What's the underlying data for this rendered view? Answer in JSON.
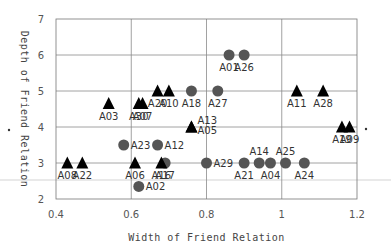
{
  "chart_data": {
    "type": "scatter",
    "title": "",
    "xlabel": "Width of Friend Relation",
    "ylabel": "Depth of Friend Relation",
    "xlim": [
      0.4,
      1.2
    ],
    "ylim": [
      2,
      7
    ],
    "xticks": [
      0.4,
      0.6,
      0.8,
      1.0,
      1.2
    ],
    "xtick_labels": [
      "0.4",
      "0.6",
      "0.8",
      "1",
      "1.2"
    ],
    "yticks": [
      2,
      3,
      4,
      5,
      6,
      7
    ],
    "ytick_labels": [
      "2",
      "3",
      "4",
      "5",
      "6",
      "7"
    ],
    "grid": true,
    "legend": "none",
    "series": [
      {
        "name": "circle",
        "marker": "circle",
        "color": "#555555",
        "points": [
          {
            "label": "A01",
            "x": 0.86,
            "y": 6.0,
            "pos": "below"
          },
          {
            "label": "A26",
            "x": 0.9,
            "y": 6.0,
            "pos": "below"
          },
          {
            "label": "A18",
            "x": 0.76,
            "y": 5.0,
            "pos": "below"
          },
          {
            "label": "A27",
            "x": 0.83,
            "y": 5.0,
            "pos": "below"
          },
          {
            "label": "A23",
            "x": 0.58,
            "y": 3.5,
            "pos": "right"
          },
          {
            "label": "A12",
            "x": 0.67,
            "y": 3.5,
            "pos": "right"
          },
          {
            "label": "A17",
            "x": 0.69,
            "y": 3.0,
            "pos": "below"
          },
          {
            "label": "A29",
            "x": 0.8,
            "y": 3.0,
            "pos": "right"
          },
          {
            "label": "A21",
            "x": 0.9,
            "y": 3.0,
            "pos": "below"
          },
          {
            "label": "A14",
            "x": 0.94,
            "y": 3.0,
            "pos": "above"
          },
          {
            "label": "A04",
            "x": 0.97,
            "y": 3.0,
            "pos": "below"
          },
          {
            "label": "A25",
            "x": 1.01,
            "y": 3.0,
            "pos": "above"
          },
          {
            "label": "A24",
            "x": 1.06,
            "y": 3.0,
            "pos": "below"
          },
          {
            "label": "A02",
            "x": 0.62,
            "y": 2.35,
            "pos": "right"
          }
        ]
      },
      {
        "name": "triangle",
        "marker": "triangle",
        "color": "#000000",
        "points": [
          {
            "label": "A20",
            "x": 0.67,
            "y": 5.0,
            "pos": "below"
          },
          {
            "label": "A10",
            "x": 0.7,
            "y": 5.0,
            "pos": "below"
          },
          {
            "label": "A11",
            "x": 1.04,
            "y": 5.0,
            "pos": "below"
          },
          {
            "label": "A28",
            "x": 1.11,
            "y": 5.0,
            "pos": "below"
          },
          {
            "label": "A03",
            "x": 0.54,
            "y": 4.65,
            "pos": "below"
          },
          {
            "label": "A30",
            "x": 0.62,
            "y": 4.65,
            "pos": "below"
          },
          {
            "label": "A07",
            "x": 0.63,
            "y": 4.65,
            "pos": "below"
          },
          {
            "label": "A13",
            "x": 0.76,
            "y": 4.0,
            "pos": "above-right"
          },
          {
            "label": "A05",
            "x": 0.76,
            "y": 4.0,
            "pos": "below-right"
          },
          {
            "label": "A19",
            "x": 1.16,
            "y": 4.0,
            "pos": "below"
          },
          {
            "label": "A09",
            "x": 1.18,
            "y": 4.0,
            "pos": "below"
          },
          {
            "label": "A08",
            "x": 0.43,
            "y": 3.0,
            "pos": "below"
          },
          {
            "label": "A22",
            "x": 0.47,
            "y": 3.0,
            "pos": "below"
          },
          {
            "label": "A06",
            "x": 0.61,
            "y": 3.0,
            "pos": "below"
          },
          {
            "label": "A16",
            "x": 0.68,
            "y": 3.0,
            "pos": "below"
          }
        ]
      }
    ]
  }
}
